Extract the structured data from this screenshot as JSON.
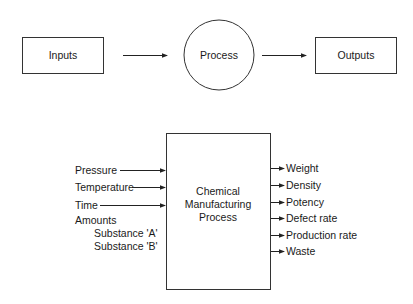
{
  "top_flow": {
    "inputs_label": "Inputs",
    "process_label": "Process",
    "outputs_label": "Outputs"
  },
  "detail": {
    "process_lines": [
      "Chemical",
      "Manufacturing",
      "Process"
    ],
    "inputs": [
      {
        "label": "Pressure",
        "arrow": true
      },
      {
        "label": "Temperature",
        "arrow": true
      },
      {
        "label": "Time",
        "arrow": true
      },
      {
        "label": "Amounts",
        "arrow": false
      },
      {
        "label": "Substance 'A'",
        "arrow": false,
        "indent": true
      },
      {
        "label": "Substance 'B'",
        "arrow": false,
        "indent": true
      }
    ],
    "outputs": [
      "Weight",
      "Density",
      "Potency",
      "Defect rate",
      "Production rate",
      "Waste"
    ]
  },
  "colors": {
    "stroke": "#333333",
    "text": "#1a1a1a",
    "background": "#ffffff"
  }
}
